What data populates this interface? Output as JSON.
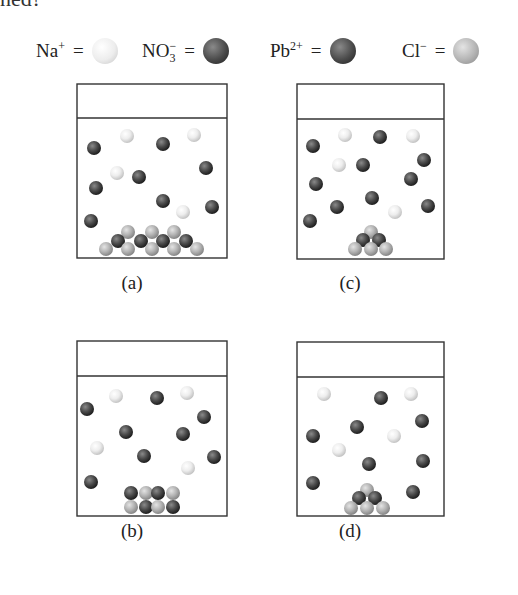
{
  "header_fragment": "ned?",
  "legend": [
    {
      "ion": "Na",
      "charge": "+",
      "sub": "",
      "sphere": "white",
      "name": "sodium-ion"
    },
    {
      "ion": "NO",
      "charge": "−",
      "sub": "3",
      "sphere": "dark",
      "name": "nitrate-ion"
    },
    {
      "ion": "Pb",
      "charge": "2+",
      "sub": "",
      "sphere": "dark",
      "name": "lead-ion"
    },
    {
      "ion": "Cl",
      "charge": "−",
      "sub": "",
      "sphere": "gray",
      "name": "chloride-ion"
    }
  ],
  "legend_equals": "=",
  "sphere_colors": {
    "white": {
      "light": "#ffffff",
      "mid": "#ededed",
      "dark": "#c4c4c4"
    },
    "dark": {
      "light": "#8a8a8a",
      "mid": "#4a4a4a",
      "dark": "#1e1e1e"
    },
    "gray": {
      "light": "#e4e4e4",
      "mid": "#b4b4b4",
      "dark": "#868686"
    }
  },
  "beakers": [
    {
      "label": "(a)",
      "box": {
        "x": 77,
        "y": 84,
        "w": 150,
        "h": 174,
        "lid": 34
      },
      "free_ions": {
        "dark": [
          [
            94,
            148
          ],
          [
            163,
            144
          ],
          [
            206,
            168
          ],
          [
            96,
            188
          ],
          [
            139,
            177
          ],
          [
            163,
            201
          ],
          [
            212,
            207
          ],
          [
            91,
            221
          ]
        ],
        "white": [
          [
            127,
            136
          ],
          [
            194,
            135
          ],
          [
            117,
            173
          ],
          [
            183,
            212
          ]
        ]
      },
      "precipitate": {
        "gray": [
          [
            128,
            232
          ],
          [
            152,
            232
          ],
          [
            174,
            232
          ],
          [
            106,
            249
          ],
          [
            128,
            249
          ],
          [
            152,
            249
          ],
          [
            174,
            249
          ],
          [
            197,
            249
          ]
        ],
        "dark": [
          [
            118,
            241
          ],
          [
            141,
            241
          ],
          [
            163,
            241
          ],
          [
            186,
            241
          ]
        ]
      },
      "caption_pos": [
        122,
        276
      ]
    },
    {
      "label": "(c)",
      "box": {
        "x": 297,
        "y": 84,
        "w": 147,
        "h": 175,
        "lid": 35
      },
      "free_ions": {
        "dark": [
          [
            313,
            146
          ],
          [
            380,
            137
          ],
          [
            424,
            160
          ],
          [
            363,
            165
          ],
          [
            316,
            184
          ],
          [
            411,
            179
          ],
          [
            372,
            198
          ],
          [
            337,
            207
          ],
          [
            428,
            206
          ],
          [
            310,
            221
          ]
        ],
        "white": [
          [
            345,
            135
          ],
          [
            413,
            136
          ],
          [
            339,
            165
          ],
          [
            395,
            212
          ]
        ]
      },
      "precipitate": {
        "gray": [
          [
            371,
            232
          ],
          [
            355,
            249
          ],
          [
            371,
            249
          ],
          [
            386,
            249
          ]
        ],
        "dark": [
          [
            363,
            240
          ],
          [
            379,
            240
          ]
        ]
      },
      "caption_pos": [
        340,
        276
      ]
    },
    {
      "label": "(b)",
      "box": {
        "x": 77,
        "y": 341,
        "w": 150,
        "h": 175,
        "lid": 35
      },
      "free_ions": {
        "dark": [
          [
            87,
            409
          ],
          [
            157,
            398
          ],
          [
            204,
            417
          ],
          [
            126,
            432
          ],
          [
            183,
            434
          ],
          [
            144,
            456
          ],
          [
            214,
            457
          ],
          [
            91,
            482
          ]
        ],
        "white": [
          [
            116,
            396
          ],
          [
            187,
            393
          ],
          [
            97,
            448
          ],
          [
            188,
            468
          ]
        ]
      },
      "precipitate": {
        "gray": [
          [
            146,
            493
          ],
          [
            173,
            493
          ],
          [
            131,
            507
          ],
          [
            158,
            507
          ]
        ],
        "dark": [
          [
            131,
            493
          ],
          [
            158,
            493
          ],
          [
            146,
            507
          ],
          [
            173,
            507
          ]
        ]
      },
      "caption_pos": [
        122,
        524
      ]
    },
    {
      "label": "(d)",
      "box": {
        "x": 297,
        "y": 342,
        "w": 147,
        "h": 174,
        "lid": 35
      },
      "free_ions": {
        "dark": [
          [
            381,
            398
          ],
          [
            422,
            421
          ],
          [
            357,
            427
          ],
          [
            313,
            436
          ],
          [
            369,
            464
          ],
          [
            423,
            461
          ],
          [
            313,
            483
          ],
          [
            413,
            492
          ]
        ],
        "white": [
          [
            324,
            394
          ],
          [
            411,
            394
          ],
          [
            394,
            436
          ],
          [
            339,
            450
          ]
        ]
      },
      "precipitate": {
        "gray": [
          [
            367,
            490
          ],
          [
            351,
            508
          ],
          [
            367,
            508
          ],
          [
            383,
            508
          ]
        ],
        "dark": [
          [
            359,
            498
          ],
          [
            375,
            498
          ]
        ]
      },
      "caption_pos": [
        340,
        524
      ]
    }
  ],
  "sphere_radius": 7
}
